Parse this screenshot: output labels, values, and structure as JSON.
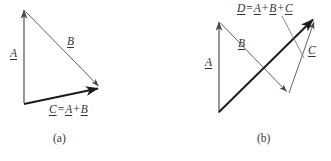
{
  "figure": {
    "background_color": "#ffffff",
    "stroke_color_thin": "#4a4a4a",
    "stroke_color_bold": "#1a1a1a",
    "text_color": "#333333",
    "width": 331,
    "height": 161
  },
  "panel_a": {
    "caption": "(a)",
    "labels": {
      "a": "A",
      "b": "B",
      "c": "C",
      "equals": "=",
      "plus": "+"
    },
    "equation": {
      "lhs": "C",
      "eq": "=",
      "term1": "A",
      "op1": "+",
      "term2": "B"
    },
    "vectors": [
      {
        "name": "A",
        "from": [
          24,
          103
        ],
        "to": [
          24,
          8
        ],
        "weight": "thin",
        "arrow": "end"
      },
      {
        "name": "B",
        "from": [
          25,
          11
        ],
        "to": [
          100,
          87
        ],
        "weight": "thin",
        "arrow": "end"
      },
      {
        "name": "C",
        "from": [
          24,
          104
        ],
        "to": [
          100,
          89
        ],
        "weight": "bold",
        "arrow": "end"
      }
    ]
  },
  "panel_b": {
    "caption": "(b)",
    "labels": {
      "a": "A",
      "b": "B",
      "c": "C",
      "d": "D"
    },
    "equation": {
      "lhs": "D",
      "eq": "=",
      "term1": "A",
      "op1": "+",
      "term2": "B",
      "op2": "+",
      "term3": "C"
    },
    "vectors": [
      {
        "name": "A",
        "from": [
          54,
          113
        ],
        "to": [
          54,
          20
        ],
        "weight": "thin",
        "arrow": "end"
      },
      {
        "name": "B",
        "from": [
          55,
          22
        ],
        "to": [
          123,
          93
        ],
        "weight": "thin",
        "arrow": "end"
      },
      {
        "name": "C",
        "from": [
          124,
          93
        ],
        "to": [
          150,
          20
        ],
        "weight": "thin",
        "arrow": "end"
      },
      {
        "name": "D",
        "from": [
          54,
          112
        ],
        "to": [
          150,
          18
        ],
        "weight": "bold",
        "arrow": "end"
      }
    ],
    "leader_line": {
      "from": [
        124,
        16
      ],
      "to": [
        143,
        60
      ]
    }
  }
}
